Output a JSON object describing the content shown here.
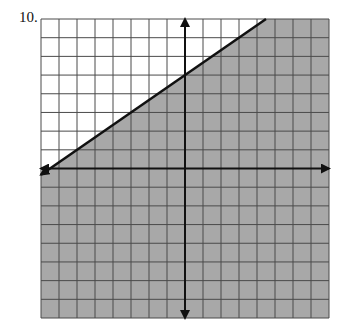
{
  "problem": {
    "number_label": "10."
  },
  "chart_data": {
    "type": "line",
    "grid": true,
    "xlim": [
      -8,
      8
    ],
    "ylim": [
      -8,
      8
    ],
    "boundary_line": {
      "slope": 0.6667,
      "intercept": 5,
      "style": "solid",
      "points": [
        [
          -8,
          -0.33
        ],
        [
          4.5,
          8
        ]
      ]
    },
    "shaded_region": "below",
    "inequality": "y <= (2/3)x + 5",
    "colors": {
      "shade": "#a8a8a8",
      "grid": "#4a4a4a",
      "axis": "#111111",
      "background": "#ffffff"
    }
  }
}
